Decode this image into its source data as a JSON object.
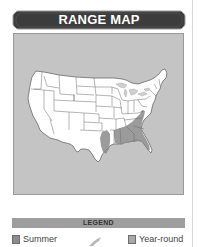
{
  "header": {
    "title": "RANGE MAP"
  },
  "map": {
    "region": "Contiguous United States",
    "background_color": "#c4c4c4",
    "land_color": "#ffffff",
    "state_border_color": "#6a6a6a",
    "range_shading_color": "#8a8a8a",
    "shaded_regions": [
      "East Texas / Louisiana border",
      "Mississippi",
      "Alabama",
      "Georgia",
      "South Carolina",
      "North Carolina",
      "Virginia coast",
      "Florida"
    ]
  },
  "legend": {
    "title": "LEGEND",
    "items": [
      {
        "label": "Summer",
        "color": "#8c8c8c"
      },
      {
        "label": "Year-round",
        "color": "#a8a8a8"
      }
    ]
  },
  "colors": {
    "banner": "#3c3c3c",
    "legend_bar": "#9e9e9e"
  }
}
